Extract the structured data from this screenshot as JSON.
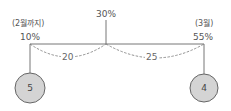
{
  "diagram": {
    "left": {
      "period": "(2월까지)",
      "value": "10%",
      "circle": "5"
    },
    "center": {
      "value": "30%"
    },
    "right": {
      "period": "(3월)",
      "value": "55%",
      "circle": "4"
    },
    "arcs": {
      "left_gap": "20",
      "right_gap": "25"
    },
    "colors": {
      "line": "#777777",
      "circle_fill": "#d4d4d4",
      "circle_stroke": "#666666",
      "dash": "#777777"
    }
  }
}
